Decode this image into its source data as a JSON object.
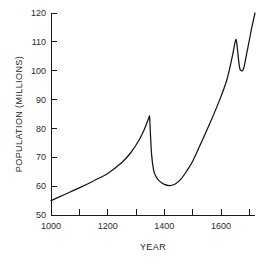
{
  "chart_data": {
    "type": "line",
    "title": "",
    "xlabel": "YEAR",
    "ylabel": "POPULATION (MILLIONS)",
    "xlim": [
      1000,
      1720
    ],
    "ylim": [
      50,
      120
    ],
    "grid": false,
    "legend": null,
    "x_ticks_major": [
      1000,
      1200,
      1400,
      1600
    ],
    "x_tick_labels": [
      "1000",
      "1200",
      "1400",
      "1600"
    ],
    "x_ticks_minor": [
      1100,
      1300,
      1500,
      1700
    ],
    "y_ticks": [
      50,
      60,
      70,
      80,
      90,
      100,
      110,
      120
    ],
    "y_tick_labels": [
      "50",
      "60",
      "70",
      "80",
      "90",
      "100",
      "110",
      "120"
    ],
    "series": [
      {
        "name": "Population",
        "x": [
          1000,
          1050,
          1100,
          1150,
          1200,
          1250,
          1280,
          1310,
          1330,
          1345,
          1348,
          1350,
          1355,
          1362,
          1370,
          1380,
          1400,
          1420,
          1440,
          1460,
          1480,
          1500,
          1530,
          1560,
          1590,
          1620,
          1640,
          1650,
          1655,
          1665,
          1672,
          1680,
          1690,
          1700,
          1710,
          1720
        ],
        "y": [
          55,
          57.2,
          59.4,
          61.8,
          64.4,
          68.2,
          71.4,
          75.8,
          79.8,
          83.6,
          84,
          80,
          71,
          65.6,
          63.4,
          62,
          60.6,
          60.2,
          60.8,
          62.6,
          65.4,
          68.6,
          75,
          81.6,
          88.6,
          96.6,
          105,
          110,
          110,
          101.4,
          100,
          100.8,
          105.6,
          110.6,
          115.6,
          120
        ]
      }
    ],
    "axis_color": "#1a1a1a",
    "line_color": "#141414",
    "background_color": "#ffffff"
  },
  "figure": {
    "plot_left_px": 51,
    "plot_right_px": 255,
    "plot_top_px": 13,
    "plot_bottom_px": 215
  }
}
